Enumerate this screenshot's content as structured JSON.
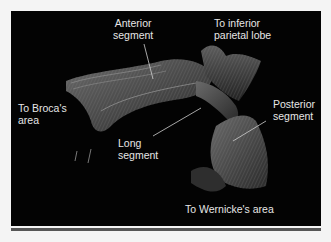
{
  "figure": {
    "background_color": "#030303",
    "label_color": "#e6e6e6",
    "labels": {
      "anterior_segment": [
        "Anterior",
        "segment"
      ],
      "inferior_parietal": [
        "To inferior",
        "parietal lobe"
      ],
      "broca": [
        "To Broca's",
        "area"
      ],
      "posterior_segment": [
        "Posterior",
        "segment"
      ],
      "long_segment": [
        "Long",
        "segment"
      ],
      "wernicke": [
        "To Wernicke's area"
      ]
    }
  }
}
